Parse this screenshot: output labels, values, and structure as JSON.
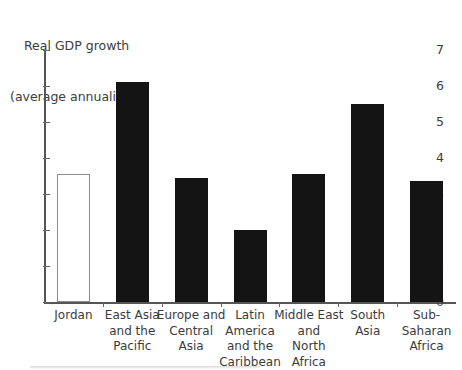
{
  "chart_data": {
    "type": "bar",
    "title": "Real GDP growth\n(average annualized)",
    "title_line_1": "Real GDP growth",
    "title_line_2": "(average annualized)",
    "xlabel": "",
    "ylabel": "",
    "ylim": [
      0,
      7
    ],
    "ytick_labels": [
      "0",
      "1",
      "2",
      "3",
      "4",
      "5",
      "6",
      "7"
    ],
    "ytick_values": [
      0,
      1,
      2,
      3,
      4,
      5,
      6,
      7
    ],
    "grid": false,
    "legend": false,
    "categories": [
      "Jordan",
      "East Asia\nand the\nPacific",
      "Europe and\nCentral Asia",
      "Latin\nAmerica\nand the\nCaribbean",
      "Middle East\nand\nNorth Africa",
      "South\nAsia",
      "Sub-Saharan\nAfrica"
    ],
    "values": [
      3.55,
      6.1,
      3.45,
      2.0,
      3.55,
      5.5,
      3.35
    ],
    "bar_styles": [
      "hollow",
      "filled",
      "filled",
      "filled",
      "filled",
      "filled",
      "filled"
    ],
    "colors": {
      "bar_fill": "#141414",
      "bar_highlight_fill": "#ffffff",
      "bar_highlight_stroke": "#8d8d8d",
      "axis": "#555555",
      "text": "#3c3c3c",
      "background": "#ffffff"
    }
  }
}
